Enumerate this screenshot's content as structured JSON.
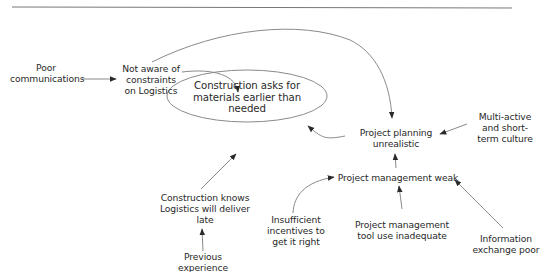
{
  "diagram": {
    "type": "cause-effect",
    "central_node": {
      "id": "construction-asks",
      "label": "Construction asks for\nmaterials earlier than\nneeded",
      "shape": "ellipse"
    },
    "nodes": [
      {
        "id": "poor-communications",
        "label": "Poor\ncommunications"
      },
      {
        "id": "not-aware",
        "label": "Not aware of\nconstraints\non Logistics"
      },
      {
        "id": "project-planning",
        "label": "Project planning\nunrealistic"
      },
      {
        "id": "multi-active",
        "label": "Multi-active\nand short-\nterm culture"
      },
      {
        "id": "pm-weak",
        "label": "Project management weak"
      },
      {
        "id": "construction-knows",
        "label": "Construction knows\nLogistics will deliver\nlate"
      },
      {
        "id": "previous-experience",
        "label": "Previous\nexperience"
      },
      {
        "id": "insufficient-incentives",
        "label": "Insufficient\nincentives to\nget it right"
      },
      {
        "id": "pm-tool",
        "label": "Project management\ntool use inadequate"
      },
      {
        "id": "info-exchange",
        "label": "Information\nexchange poor"
      }
    ],
    "edges": [
      {
        "from": "poor-communications",
        "to": "not-aware"
      },
      {
        "from": "not-aware",
        "to": "construction-asks"
      },
      {
        "from": "not-aware",
        "to": "project-planning"
      },
      {
        "from": "project-planning",
        "to": "construction-asks"
      },
      {
        "from": "multi-active",
        "to": "project-planning"
      },
      {
        "from": "pm-weak",
        "to": "project-planning"
      },
      {
        "from": "insufficient-incentives",
        "to": "pm-weak"
      },
      {
        "from": "pm-tool",
        "to": "pm-weak"
      },
      {
        "from": "info-exchange",
        "to": "pm-weak"
      },
      {
        "from": "construction-knows",
        "to": "construction-asks"
      },
      {
        "from": "previous-experience",
        "to": "construction-knows"
      }
    ],
    "colors": {
      "line": "#8a8a8a",
      "arrowhead": "#2a2a2a",
      "text": "#2a2a2a",
      "rule": "#777777"
    }
  }
}
